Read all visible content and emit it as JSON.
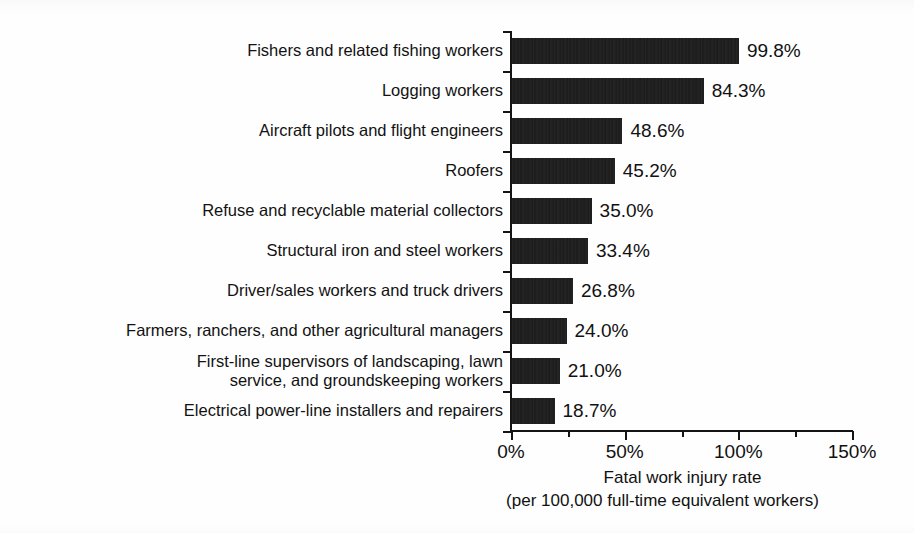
{
  "chart_data": {
    "type": "bar",
    "orientation": "horizontal",
    "title": "",
    "xlabel": "Fatal work injury rate",
    "xlabel_line2": "(per 100,000 full-time equivalent workers)",
    "ylabel": "",
    "xlim": [
      0,
      150
    ],
    "grid": false,
    "legend": null,
    "tick_labels": [
      "0%",
      "50%",
      "100%",
      "150%"
    ],
    "tick_values": [
      0,
      50,
      100,
      150
    ],
    "minor_tick_values": [
      25,
      75,
      125
    ],
    "value_suffix": "%",
    "bar_color": "#1b1b1b",
    "categories": [
      "Fishers and related fishing workers",
      "Logging workers",
      "Aircraft pilots and flight engineers",
      "Roofers",
      "Refuse and recyclable material collectors",
      "Structural iron and steel workers",
      "Driver/sales workers and truck drivers",
      "Farmers, ranchers, and other agricultural managers",
      "First-line supervisors of landscaping, lawn\nservice, and groundskeeping workers",
      "Electrical power-line installers and repairers"
    ],
    "values": [
      99.8,
      84.3,
      48.6,
      45.2,
      35.0,
      33.4,
      26.8,
      24.0,
      21.0,
      18.7
    ],
    "value_labels": [
      "99.8%",
      "84.3%",
      "48.6%",
      "45.2%",
      "35.0%",
      "33.4%",
      "26.8%",
      "24.0%",
      "21.0%",
      "18.7%"
    ]
  }
}
